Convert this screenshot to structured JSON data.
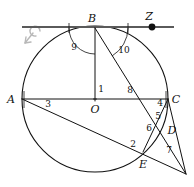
{
  "figure": {
    "kind": "circle-geometry-diagram",
    "background_color": "#ffffff",
    "ink_color": "#111111",
    "tangent_color": "#5a5a5a",
    "watermark_color": "#b8b8b8",
    "width": 194,
    "height": 187
  },
  "points": [
    {
      "id": "B",
      "label": "B",
      "x": 95,
      "y": 28,
      "label_x": 92,
      "label_y": 22,
      "dot": false
    },
    {
      "id": "Z",
      "label": "Z",
      "x": 152,
      "y": 27,
      "label_x": 149,
      "label_y": 20,
      "dot": true
    },
    {
      "id": "A",
      "label": "A",
      "x": 22,
      "y": 99,
      "label_x": 10,
      "label_y": 102,
      "dot": false
    },
    {
      "id": "O",
      "label": "O",
      "x": 95,
      "y": 99,
      "label_x": 91,
      "label_y": 112,
      "dot": false
    },
    {
      "id": "C",
      "label": "C",
      "x": 168,
      "y": 99,
      "label_x": 172,
      "label_y": 103,
      "dot": false
    },
    {
      "id": "D",
      "label": "D",
      "x": 163,
      "y": 129,
      "label_x": 168,
      "label_y": 133,
      "dot": false
    },
    {
      "id": "E",
      "label": "E",
      "x": 143,
      "y": 152,
      "label_x": 139,
      "label_y": 166,
      "dot": false
    }
  ],
  "angles": [
    {
      "id": "1",
      "label": "1",
      "x": 98,
      "y": 90,
      "vertex": "O",
      "between": "OB-OC"
    },
    {
      "id": "2",
      "label": "2",
      "x": 132,
      "y": 145,
      "vertex": "E",
      "between": "EA-ED"
    },
    {
      "id": "3",
      "label": "3",
      "x": 45,
      "y": 105,
      "vertex": "A",
      "between": "AC-AE"
    },
    {
      "id": "4",
      "label": "4",
      "x": 158,
      "y": 104,
      "vertex": "C",
      "between": "CA-CE"
    },
    {
      "id": "5",
      "label": "5",
      "x": 157,
      "y": 117,
      "vertex": "C",
      "between": "CE-CD"
    },
    {
      "id": "6",
      "label": "6",
      "x": 148,
      "y": 129,
      "vertex": "D",
      "between": "DB-DC"
    },
    {
      "id": "7",
      "label": "7",
      "x": 167,
      "y": 151,
      "vertex": "P",
      "between": "PD-PE"
    },
    {
      "id": "8",
      "label": "8",
      "x": 127,
      "y": 91,
      "vertex": "F",
      "between": "FB-FC"
    },
    {
      "id": "9",
      "label": "9",
      "x": 72,
      "y": 47,
      "vertex": "B",
      "between": "BT-BO"
    },
    {
      "id": "10",
      "label": "10",
      "x": 122,
      "y": 50,
      "vertex": "B",
      "between": "BE-BZ"
    }
  ],
  "circle": {
    "cx": 95,
    "cy": 99,
    "r": 73
  },
  "segments": [
    {
      "name": "tangent-at-B",
      "x1": 22,
      "y1": 27,
      "x2": 174,
      "y2": 27
    },
    {
      "name": "diameter-AC",
      "x1": 22,
      "y1": 99,
      "x2": 168,
      "y2": 99
    },
    {
      "name": "radius-BO",
      "x1": 95,
      "y1": 28,
      "x2": 95,
      "y2": 101
    },
    {
      "name": "chord-BE-ext",
      "x1": 95,
      "y1": 28,
      "x2": 186,
      "y2": 174
    },
    {
      "name": "chord-AE-ext",
      "x1": 22,
      "y1": 99,
      "x2": 186,
      "y2": 174
    },
    {
      "name": "chord-CE",
      "x1": 168,
      "y1": 99,
      "x2": 143,
      "y2": 152
    },
    {
      "name": "chord-CD-ext",
      "x1": 168,
      "y1": 99,
      "x2": 186,
      "y2": 174
    }
  ],
  "angle_arcs": [
    {
      "name": "arc-9",
      "cx": 95,
      "cy": 28,
      "r": 26,
      "a1": 180,
      "a2": 270
    },
    {
      "name": "arc-10",
      "cx": 95,
      "cy": 28,
      "r": 33,
      "a1": 0,
      "a2": 58
    }
  ]
}
